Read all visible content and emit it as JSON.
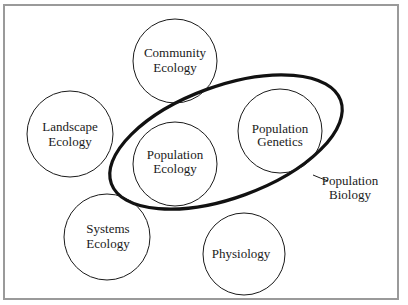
{
  "diagram": {
    "nodes": [
      {
        "id": "community",
        "line1": "Community",
        "line2": "Ecology",
        "cx": 175,
        "cy": 61,
        "r": 42
      },
      {
        "id": "landscape",
        "line1": "Landscape",
        "line2": "Ecology",
        "cx": 70,
        "cy": 134,
        "r": 43
      },
      {
        "id": "pop-ecology",
        "line1": "Population",
        "line2": "Ecology",
        "cx": 175,
        "cy": 164,
        "r": 42
      },
      {
        "id": "pop-genetics",
        "line1": "Population",
        "line2": "Genetics",
        "cx": 280,
        "cy": 131,
        "r": 42
      },
      {
        "id": "systems",
        "line1": "Systems",
        "line2": "Ecology",
        "cx": 107,
        "cy": 237,
        "r": 43
      },
      {
        "id": "physiology",
        "line1": "Physiology",
        "line2": "",
        "cx": 244,
        "cy": 254,
        "r": 41
      }
    ],
    "group": {
      "label_line1": "Population",
      "label_line2": "Biology",
      "members": [
        "Population Ecology",
        "Population Genetics"
      ]
    },
    "colors": {
      "stroke": "#1a1a1a",
      "frame": "#9a9a9a",
      "background": "#ffffff"
    }
  }
}
